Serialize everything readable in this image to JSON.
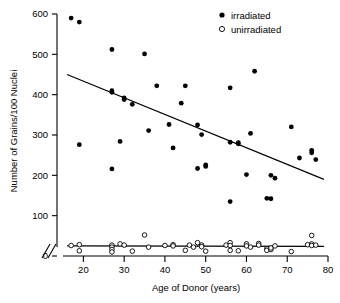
{
  "chart_data": {
    "type": "scatter",
    "title": "",
    "xlabel": "Age of Donor (years)",
    "ylabel": "Number of Grains/100 Nuclei",
    "xlim": [
      15,
      80
    ],
    "ylim": [
      0,
      600
    ],
    "xticks": [
      20,
      30,
      40,
      50,
      60,
      70,
      80
    ],
    "yticks": [
      0,
      100,
      200,
      300,
      400,
      500,
      600
    ],
    "grid": false,
    "legend_position": "top-right",
    "axis_break": {
      "axis": "x",
      "symbol": "//",
      "note": "break between 0 and start of age scale"
    },
    "series": [
      {
        "name": "irradiated",
        "marker": "filled-circle",
        "color": "#000000",
        "points": [
          [
            17,
            590
          ],
          [
            19,
            580
          ],
          [
            27,
            512
          ],
          [
            35,
            501
          ],
          [
            62,
            458
          ],
          [
            38,
            422
          ],
          [
            45,
            422
          ],
          [
            56,
            417
          ],
          [
            27,
            410
          ],
          [
            27,
            406
          ],
          [
            30,
            392
          ],
          [
            30,
            388
          ],
          [
            44,
            379
          ],
          [
            32,
            376
          ],
          [
            71,
            320
          ],
          [
            41,
            326
          ],
          [
            48,
            325
          ],
          [
            36,
            311
          ],
          [
            61,
            304
          ],
          [
            49,
            301
          ],
          [
            56,
            282
          ],
          [
            58,
            281
          ],
          [
            58,
            278
          ],
          [
            19,
            276
          ],
          [
            29,
            284
          ],
          [
            42,
            268
          ],
          [
            76,
            262
          ],
          [
            76,
            256
          ],
          [
            73,
            243
          ],
          [
            77,
            239
          ],
          [
            50,
            226
          ],
          [
            50,
            222
          ],
          [
            48,
            217
          ],
          [
            27,
            216
          ],
          [
            66,
            200
          ],
          [
            60,
            202
          ],
          [
            67,
            193
          ],
          [
            65,
            143
          ],
          [
            66,
            142
          ],
          [
            56,
            135
          ]
        ]
      },
      {
        "name": "unirradiated",
        "marker": "open-circle",
        "color": "#000000",
        "points": [
          [
            17,
            26
          ],
          [
            19,
            28
          ],
          [
            19,
            13
          ],
          [
            27,
            27
          ],
          [
            27,
            22
          ],
          [
            27,
            16
          ],
          [
            27,
            10
          ],
          [
            29,
            30
          ],
          [
            30,
            27
          ],
          [
            32,
            12
          ],
          [
            35,
            52
          ],
          [
            36,
            22
          ],
          [
            40,
            26
          ],
          [
            42,
            28
          ],
          [
            42,
            25
          ],
          [
            45,
            14
          ],
          [
            46,
            27
          ],
          [
            47,
            22
          ],
          [
            48,
            33
          ],
          [
            49,
            27
          ],
          [
            49,
            23
          ],
          [
            50,
            12
          ],
          [
            55,
            27
          ],
          [
            56,
            33
          ],
          [
            56,
            26
          ],
          [
            56,
            14
          ],
          [
            58,
            13
          ],
          [
            60,
            30
          ],
          [
            60,
            25
          ],
          [
            61,
            22
          ],
          [
            63,
            31
          ],
          [
            63,
            27
          ],
          [
            65,
            18
          ],
          [
            65,
            14
          ],
          [
            66,
            16
          ],
          [
            66,
            20
          ],
          [
            67,
            25
          ],
          [
            71,
            11
          ],
          [
            75,
            28
          ],
          [
            76,
            51
          ],
          [
            76,
            30
          ],
          [
            76,
            26
          ],
          [
            77,
            27
          ]
        ]
      }
    ],
    "trend_lines": [
      {
        "name": "irradiated-fit",
        "x_start": 16,
        "y_start": 450,
        "x_end": 79,
        "y_end": 190
      },
      {
        "name": "unirradiated-fit",
        "x_start": 16,
        "y_start": 25,
        "x_end": 79,
        "y_end": 24
      }
    ]
  },
  "legend": {
    "entries": [
      {
        "label": "irradiated",
        "marker": "filled-circle"
      },
      {
        "label": "unirradiated",
        "marker": "open-circle"
      }
    ]
  },
  "axes": {
    "x_title": "Age of Donor (years)",
    "y_title": "Number of Grains/100 Nuclei",
    "x_tick_labels": [
      "20",
      "30",
      "40",
      "50",
      "60",
      "70",
      "80"
    ],
    "y_tick_labels": [
      "0",
      "100",
      "200",
      "300",
      "400",
      "500",
      "600"
    ]
  }
}
